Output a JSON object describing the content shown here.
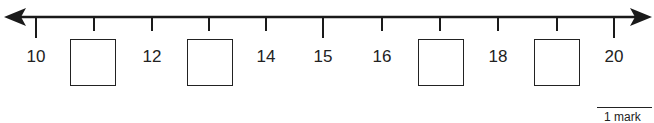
{
  "number_line": {
    "start": 10,
    "end": 20,
    "step": 1,
    "ticks": [
      {
        "value": 10,
        "label": "10",
        "x": 36,
        "major": true
      },
      {
        "value": 11,
        "label": null,
        "x": 94,
        "major": false,
        "answer_box": true
      },
      {
        "value": 12,
        "label": "12",
        "x": 152,
        "major": false
      },
      {
        "value": 13,
        "label": null,
        "x": 209,
        "major": false,
        "answer_box": true
      },
      {
        "value": 14,
        "label": "14",
        "x": 266,
        "major": false
      },
      {
        "value": 15,
        "label": "15",
        "x": 323,
        "major": true
      },
      {
        "value": 16,
        "label": "16",
        "x": 382,
        "major": false
      },
      {
        "value": 17,
        "label": null,
        "x": 440,
        "major": false,
        "answer_box": true
      },
      {
        "value": 18,
        "label": "18",
        "x": 498,
        "major": false
      },
      {
        "value": 19,
        "label": null,
        "x": 557,
        "major": false,
        "answer_box": true
      },
      {
        "value": 20,
        "label": "20",
        "x": 614,
        "major": true
      }
    ],
    "labels": {
      "l10": "10",
      "l12": "12",
      "l14": "14",
      "l15": "15",
      "l16": "16",
      "l18": "18",
      "l20": "20"
    }
  },
  "answer_boxes": [
    {
      "position": 11,
      "value": ""
    },
    {
      "position": 13,
      "value": ""
    },
    {
      "position": 17,
      "value": ""
    },
    {
      "position": 19,
      "value": ""
    }
  ],
  "marks": {
    "label": "1 mark"
  },
  "colors": {
    "line": "#1a1a1a",
    "background": "#ffffff"
  }
}
